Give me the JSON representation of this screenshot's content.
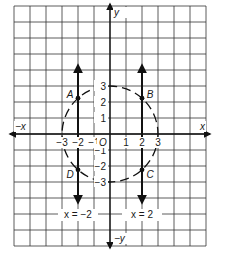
{
  "diagram": {
    "type": "coordinate-plane",
    "grid": {
      "x_min": -6,
      "x_max": 6,
      "y_min": -7,
      "y_max": 8,
      "cell_px": 16,
      "origin_px": [
        110,
        134
      ]
    },
    "axes": {
      "x_pos_label": "x",
      "x_neg_label": "−x",
      "y_pos_label": "y",
      "y_neg_label": "−y",
      "origin_label": "O"
    },
    "x_ticks": [
      {
        "value": -3,
        "label": "−3"
      },
      {
        "value": -2,
        "label": "−2"
      },
      {
        "value": -1,
        "label": "−1"
      },
      {
        "value": 1,
        "label": "1"
      },
      {
        "value": 2,
        "label": "2"
      },
      {
        "value": 3,
        "label": "3"
      }
    ],
    "y_ticks": [
      {
        "value": 3,
        "label": "3"
      },
      {
        "value": 2,
        "label": "2"
      },
      {
        "value": 1,
        "label": "1"
      },
      {
        "value": -1,
        "label": "−1"
      },
      {
        "value": -2,
        "label": "−2"
      },
      {
        "value": -3,
        "label": "−3"
      }
    ],
    "circle": {
      "center": [
        0,
        0
      ],
      "radius": 3,
      "style": "dashed"
    },
    "lines": [
      {
        "label": "x = −2",
        "x": -2,
        "y_from": -4.3,
        "y_to": 4.3
      },
      {
        "label": "x = 2",
        "x": 2,
        "y_from": -4.3,
        "y_to": 4.3
      }
    ],
    "points": [
      {
        "label": "A",
        "x": -2,
        "y": 2.236
      },
      {
        "label": "B",
        "x": 2,
        "y": 2.236
      },
      {
        "label": "C",
        "x": 2,
        "y": -2.236
      },
      {
        "label": "D",
        "x": -2,
        "y": -2.236
      }
    ],
    "colors": {
      "grid": "#333333",
      "ink": "#111111",
      "background": "#ffffff"
    }
  }
}
